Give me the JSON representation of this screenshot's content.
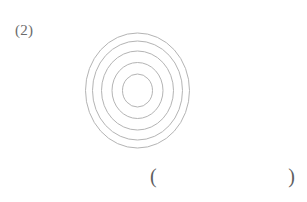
{
  "page": {
    "background_color": "#ffffff",
    "width": 307,
    "height": 202
  },
  "question": {
    "label": "(2)",
    "label_color": "#6b6b6b"
  },
  "figure": {
    "name": "concentric-circles",
    "stroke_color": "#b4b4b4",
    "fill": "none",
    "stroke_width": 1,
    "center": {
      "x": 57.5,
      "y": 62.5
    },
    "rings": [
      {
        "rx": 52.0,
        "ry": 57.5
      },
      {
        "rx": 45.0,
        "ry": 49.5
      },
      {
        "rx": 36.0,
        "ry": 39.5
      },
      {
        "rx": 25.5,
        "ry": 28.0
      },
      {
        "rx": 15.0,
        "ry": 16.5
      }
    ]
  },
  "answer": {
    "open_paren": "(",
    "close_paren": ")",
    "value": "",
    "placeholder": ""
  }
}
